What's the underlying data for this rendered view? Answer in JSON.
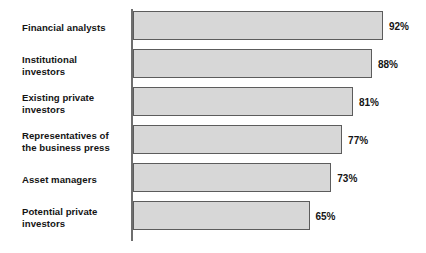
{
  "chart_data": {
    "type": "bar",
    "orientation": "horizontal",
    "title": "",
    "subtitle": "",
    "xlabel": "",
    "ylabel": "",
    "xlim": [
      0,
      100
    ],
    "grid": false,
    "legend": null,
    "value_suffix": "%",
    "categories": [
      "Financial analysts",
      "Institutional investors",
      "Existing private investors",
      "Representatives of the business press",
      "Asset managers",
      "Potential private investors"
    ],
    "values": [
      92,
      88,
      81,
      77,
      73,
      65
    ],
    "value_labels": [
      "92%",
      "88%",
      "81%",
      "77%",
      "73%",
      "65%"
    ],
    "colors": {
      "bar_fill": "#d7d7d7",
      "bar_border": "#5c5c5c",
      "axis": "#6e6e6e",
      "text": "#141414",
      "background": "#ffffff"
    }
  },
  "bars": [
    {
      "label_line1": "Financial analysts",
      "label_line2": "",
      "value": 92,
      "value_label": "92%"
    },
    {
      "label_line1": "Institutional",
      "label_line2": "investors",
      "value": 88,
      "value_label": "88%"
    },
    {
      "label_line1": "Existing private",
      "label_line2": "investors",
      "value": 81,
      "value_label": "81%"
    },
    {
      "label_line1": "Representatives of",
      "label_line2": "the business press",
      "value": 77,
      "value_label": "77%"
    },
    {
      "label_line1": "Asset managers",
      "label_line2": "",
      "value": 73,
      "value_label": "73%"
    },
    {
      "label_line1": "Potential private",
      "label_line2": "investors",
      "value": 65,
      "value_label": "65%"
    }
  ]
}
